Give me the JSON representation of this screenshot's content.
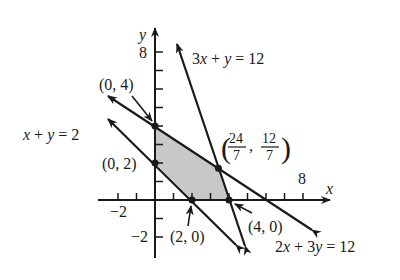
{
  "axes": {
    "x_label": "x",
    "y_label": "y",
    "x_ticks": {
      "neg2": "−2",
      "pos8": "8"
    },
    "y_ticks": {
      "pos8": "8",
      "neg2": "−2"
    }
  },
  "lines": {
    "l1": {
      "eq_a": "3",
      "eq_var1": "x",
      "eq_op": " + ",
      "eq_var2": "y",
      "eq_rhs": " = 12"
    },
    "l2": {
      "eq_var1": "x",
      "eq_op": " + ",
      "eq_var2": "y",
      "eq_rhs": " = 2"
    },
    "l3": {
      "eq_a": "2",
      "eq_var1": "x",
      "eq_op": " + 3",
      "eq_var2": "y",
      "eq_rhs": " = 12"
    }
  },
  "points": {
    "p04": "(0, 4)",
    "p02": "(0, 2)",
    "p20": "(2, 0)",
    "p40": "(4, 0)",
    "pint": {
      "open": "(",
      "x_num": "24",
      "x_den": "7",
      "comma": ",",
      "y_num": "12",
      "y_den": "7",
      "close": ")"
    }
  },
  "colors": {
    "line": "#1a1a1a",
    "region": "#c8c8c8"
  }
}
